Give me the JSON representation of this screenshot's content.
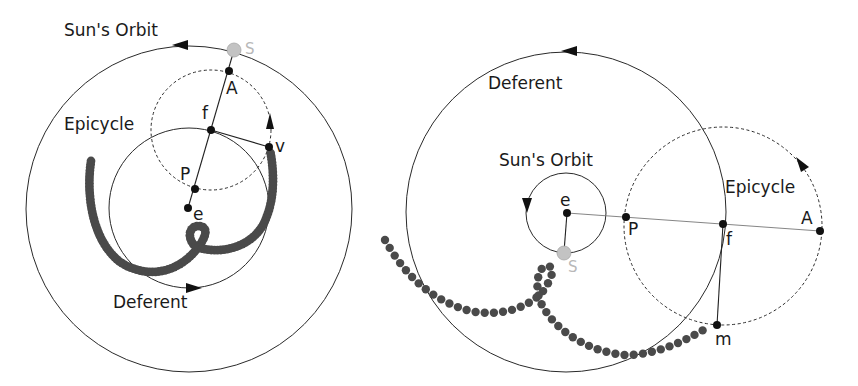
{
  "figure": {
    "panels": [
      {
        "id": "left",
        "title_labels": {
          "sun_orbit": "Sun's Orbit",
          "epicycle": "Epicycle",
          "deferent": "Deferent",
          "sun": "S"
        },
        "point_labels": {
          "A": "A",
          "f": "f",
          "P": "P",
          "e": "e",
          "v": "v"
        }
      },
      {
        "id": "right",
        "title_labels": {
          "sun_orbit": "Sun's Orbit",
          "epicycle": "Epicycle",
          "deferent": "Deferent",
          "sun": "S"
        },
        "point_labels": {
          "A": "A",
          "f": "f",
          "P": "P",
          "e": "e",
          "m": "m"
        }
      }
    ],
    "colors": {
      "stroke": "#2a2a2a",
      "point": "#111111",
      "sun_fill": "#c3c3c3",
      "sun_label": "#b8b8b8",
      "trail": "#4a4a4a"
    },
    "trails": {
      "left": {
        "path": "M91,161 C86,195 92,240 120,262 C148,280 178,272 196,250 C206,238 210,226 198,226 C186,226 188,246 200,248 C220,254 250,248 263,225 C276,200 274,170 270,150",
        "spacing": 3.2,
        "radius": 4.4
      },
      "right": {
        "path": "M385,240 C405,275 430,300 470,311 C505,318 532,305 544,290 C552,278 556,266 547,266 C537,266 534,290 542,305 C556,332 590,352 625,355 C660,355 690,338 710,326",
        "spacing": 9.2,
        "radius": 4.2
      }
    }
  }
}
